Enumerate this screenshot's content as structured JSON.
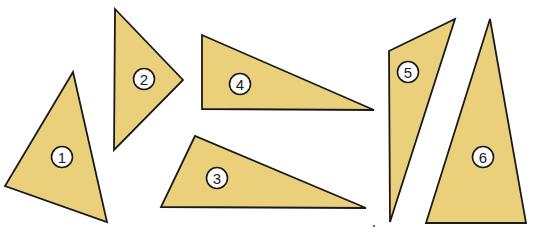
{
  "diagram": {
    "fill_color": "#EBD07C",
    "stroke_color": "#1a1a1a",
    "label_circle_fill": "#ffffff",
    "triangles": [
      {
        "id": "1",
        "label": "1",
        "points": "73,72 5,186 107,222",
        "label_pos": [
          62,
          157
        ]
      },
      {
        "id": "2",
        "label": "2",
        "points": "115,9 183,80 114,150",
        "label_pos": [
          144,
          79
        ]
      },
      {
        "id": "3",
        "label": "3",
        "points": "195,136 161,207 366,208",
        "label_pos": [
          217,
          178
        ]
      },
      {
        "id": "4",
        "label": "4",
        "points": "202,35 202,109 374,110",
        "label_pos": [
          240,
          84
        ]
      },
      {
        "id": "5",
        "label": "5",
        "points": "389,51 455,19 390,222",
        "label_pos": [
          408,
          72
        ]
      },
      {
        "id": "6",
        "label": "6",
        "points": "490,19 426,223 526,223",
        "label_pos": [
          483,
          157
        ]
      }
    ]
  }
}
